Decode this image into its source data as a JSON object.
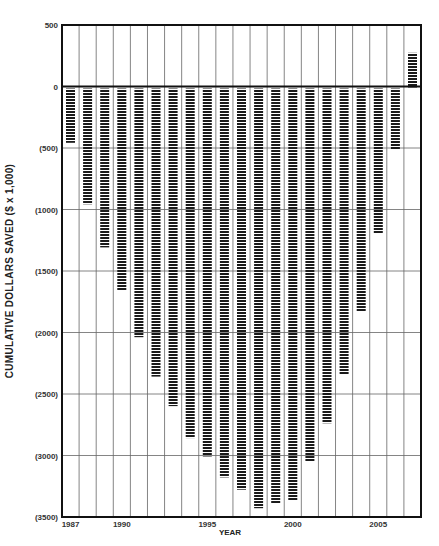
{
  "chart_data": {
    "type": "bar",
    "title": "",
    "xlabel": "YEAR",
    "ylabel": "CUMULATIVE DOLLARS SAVED ($ x 1,000)",
    "ylim": [
      -3500,
      500
    ],
    "y_ticks": [
      500,
      0,
      -500,
      -1000,
      -1500,
      -2000,
      -2500,
      -3000,
      -3500
    ],
    "y_tick_labels": [
      "500",
      "0",
      "(500)",
      "(1000)",
      "(1500)",
      "(2000)",
      "(2500)",
      "(3000)",
      "(3500)"
    ],
    "x_tick_labels": [
      {
        "label": "1987",
        "index": 0
      },
      {
        "label": "1990",
        "index": 3
      },
      {
        "label": "1995",
        "index": 8
      },
      {
        "label": "2000",
        "index": 13
      },
      {
        "label": "2005",
        "index": 18
      }
    ],
    "grid": true,
    "legend": null,
    "bar_style": "horizontal-striped",
    "colors": {
      "bar": "#1a1a1a",
      "grid": "#666666",
      "axis": "#111111",
      "background": "#ffffff"
    },
    "categories": [
      "1987",
      "1988",
      "1989",
      "1990",
      "1991",
      "1992",
      "1993",
      "1994",
      "1995",
      "1996",
      "1997",
      "1998",
      "1999",
      "2000",
      "2001",
      "2002",
      "2003",
      "2004",
      "2005",
      "2006",
      "2007"
    ],
    "values": [
      -450,
      -950,
      -1300,
      -1650,
      -2030,
      -2350,
      -2590,
      -2850,
      -3000,
      -3170,
      -3270,
      -3420,
      -3380,
      -3360,
      -3040,
      -2730,
      -2330,
      -1820,
      -1190,
      -500,
      290
    ]
  }
}
